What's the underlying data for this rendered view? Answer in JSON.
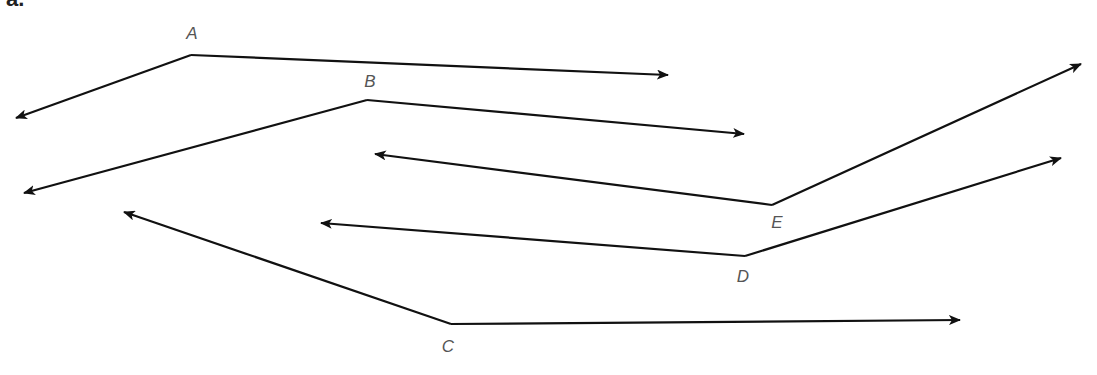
{
  "figure": {
    "corner_label": "a.",
    "stroke_color": "#111111",
    "label_color": "#555555"
  },
  "angles": [
    {
      "name": "A",
      "vertex": [
        191,
        55
      ],
      "label_pos": [
        192,
        33
      ],
      "rays": [
        [
          16,
          118
        ],
        [
          668,
          75
        ]
      ]
    },
    {
      "name": "B",
      "vertex": [
        367,
        100
      ],
      "label_pos": [
        370,
        81
      ],
      "rays": [
        [
          24,
          193
        ],
        [
          744,
          134
        ]
      ]
    },
    {
      "name": "C",
      "vertex": [
        451,
        324
      ],
      "label_pos": [
        448,
        346
      ],
      "rays": [
        [
          124,
          212
        ],
        [
          960,
          320
        ]
      ]
    },
    {
      "name": "D",
      "vertex": [
        745,
        256
      ],
      "label_pos": [
        743,
        276
      ],
      "rays": [
        [
          321,
          223
        ],
        [
          1061,
          158
        ]
      ]
    },
    {
      "name": "E",
      "vertex": [
        772,
        205
      ],
      "label_pos": [
        777,
        222
      ],
      "rays": [
        [
          375,
          154
        ],
        [
          1081,
          64
        ]
      ]
    }
  ]
}
